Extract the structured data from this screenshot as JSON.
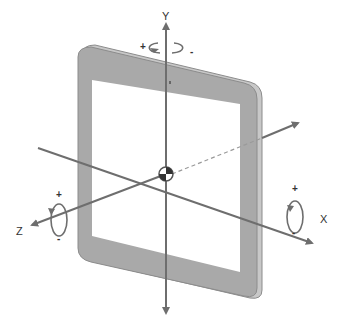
{
  "diagram": {
    "type": "device-coordinate-system",
    "device": "tablet",
    "colors": {
      "bezel": "#a9a9a9",
      "bezel_edge": "#8c8c8c",
      "screen": "#ffffff",
      "axis": "#6e6e6e",
      "text": "#333333"
    },
    "axes": {
      "y": {
        "label": "Y",
        "rotation_plus": "+",
        "rotation_minus": "-"
      },
      "x": {
        "label": "X",
        "rotation_plus": "+",
        "rotation_minus": "-"
      },
      "z": {
        "label": "Z",
        "rotation_plus": "+",
        "rotation_minus": "-"
      }
    }
  }
}
